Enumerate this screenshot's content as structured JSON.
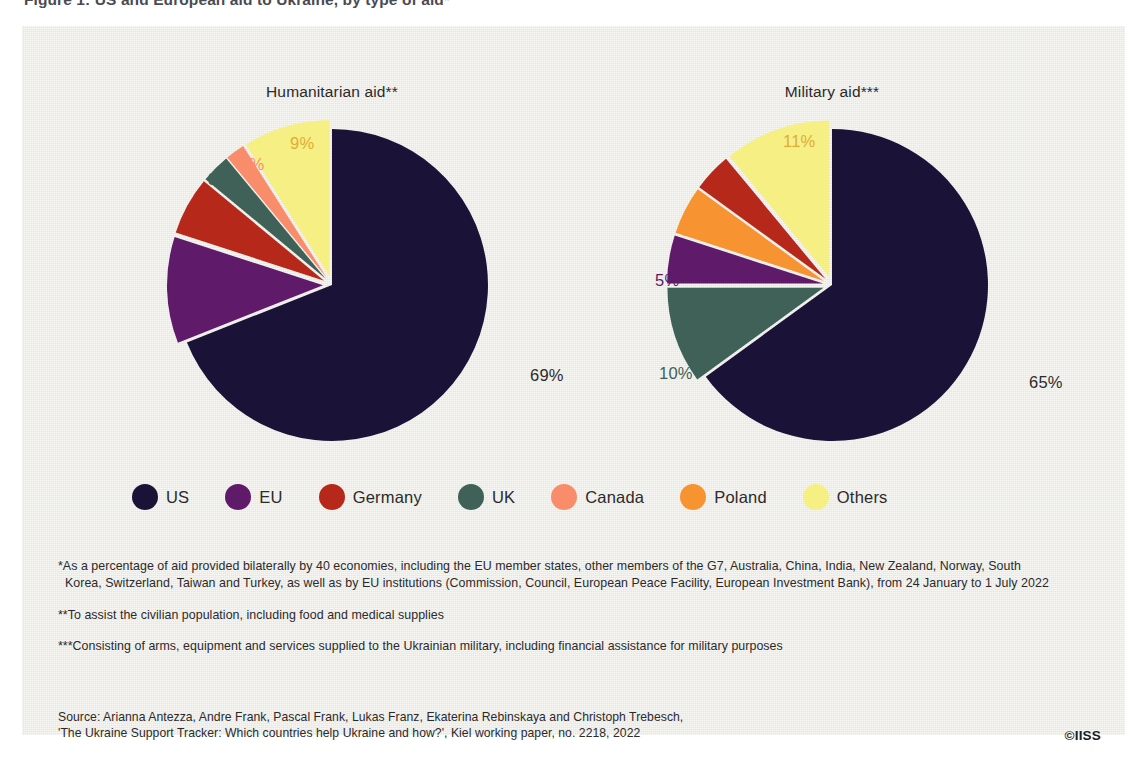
{
  "page": {
    "headline": "Figure 1: US and European aid to Ukraine, by type of aid*",
    "copyright": "©IISS"
  },
  "chart_data": [
    {
      "type": "pie",
      "title": "Humanitarian aid**",
      "categories": [
        "US",
        "EU",
        "Germany",
        "UK",
        "Canada",
        "Others"
      ],
      "values": [
        69,
        11,
        6,
        3,
        2,
        9
      ],
      "labels": [
        "69%",
        "11%",
        "6%",
        "3%",
        "2%",
        "9%"
      ],
      "unit": "%",
      "legend_position": "bottom",
      "exploded": [
        "EU",
        "Germany",
        "UK",
        "Canada",
        "Others"
      ],
      "start_angle_deg": 0,
      "direction": "clockwise"
    },
    {
      "type": "pie",
      "title": "Military aid***",
      "categories": [
        "US",
        "UK",
        "EU",
        "Poland",
        "Germany",
        "Others"
      ],
      "values": [
        65,
        10,
        5,
        5,
        4,
        11
      ],
      "labels": [
        "65%",
        "10%",
        "5%",
        "5%",
        "4%",
        "11%"
      ],
      "unit": "%",
      "legend_position": "bottom",
      "exploded": [
        "UK",
        "EU",
        "Poland",
        "Germany",
        "Others"
      ],
      "start_angle_deg": 0,
      "direction": "clockwise"
    }
  ],
  "legend": {
    "items": [
      {
        "label": "US",
        "color": "#1b1238"
      },
      {
        "label": "EU",
        "color": "#5f1a6a"
      },
      {
        "label": "Germany",
        "color": "#b5281a"
      },
      {
        "label": "UK",
        "color": "#3f6158"
      },
      {
        "label": "Canada",
        "color": "#f98d6b"
      },
      {
        "label": "Poland",
        "color": "#f79431"
      },
      {
        "label": "Others",
        "color": "#f5ef84"
      }
    ]
  },
  "label_colors": {
    "US": "#2c2a2b",
    "EU": "#5f1a6a",
    "Germany": "#b5281a",
    "UK": "#3f6158",
    "Canada": "#f98d6b",
    "Poland": "#f79431",
    "Others": "#e0ac3a"
  },
  "notes": [
    {
      "id": "note-1",
      "line1": "*As a percentage of aid provided bilaterally by 40 economies, including the EU member states, other members of the G7, Australia, China, India, New Zealand, Norway, South",
      "line2": "Korea, Switzerland, Taiwan and Turkey, as well as by EU institutions (Commission, Council, European Peace Facility, European Investment Bank), from 24 January to 1 July 2022"
    },
    {
      "id": "note-2",
      "line1": "**To assist the civilian population, including food and medical supplies"
    },
    {
      "id": "note-3",
      "line1": "***Consisting of arms, equipment and services supplied to the Ukrainian military, including financial assistance for military purposes"
    }
  ],
  "source": {
    "line1": "Source: Arianna Antezza, Andre Frank, Pascal Frank, Lukas Franz, Ekaterina Rebinskaya and Christoph Trebesch,",
    "line2": "'The Ukraine Support Tracker: Which countries help Ukraine and how?', Kiel working paper, no. 2218, 2022"
  },
  "geometry": {
    "pies": [
      {
        "cx": 310,
        "cy": 259,
        "r": 156,
        "explode": 9
      },
      {
        "cx": 810,
        "cy": 259,
        "r": 156,
        "explode": 9
      }
    ],
    "callouts": [
      {
        "chart": 0,
        "category": "Others",
        "text": "9%",
        "x": 268,
        "y": 108
      },
      {
        "chart": 0,
        "category": "Canada",
        "text": "2%",
        "x": 218,
        "y": 129
      },
      {
        "chart": 0,
        "category": "UK",
        "text": "3%",
        "x": 186,
        "y": 144
      },
      {
        "chart": 0,
        "category": "Germany",
        "text": "6%",
        "x": 168,
        "y": 190
      },
      {
        "chart": 0,
        "category": "EU",
        "text": "11%",
        "x": 154,
        "y": 270
      },
      {
        "chart": 0,
        "category": "US",
        "text": "69%",
        "x": 508,
        "y": 340
      },
      {
        "chart": 1,
        "category": "Others",
        "text": "11%",
        "x": 761,
        "y": 106
      },
      {
        "chart": 1,
        "category": "Germany",
        "text": "4%",
        "x": 691,
        "y": 155
      },
      {
        "chart": 1,
        "category": "Poland",
        "text": "5%",
        "x": 660,
        "y": 195
      },
      {
        "chart": 1,
        "category": "EU",
        "text": "5%",
        "x": 633,
        "y": 245
      },
      {
        "chart": 1,
        "category": "UK",
        "text": "10%",
        "x": 637,
        "y": 338
      },
      {
        "chart": 1,
        "category": "US",
        "text": "65%",
        "x": 1007,
        "y": 347
      }
    ]
  }
}
